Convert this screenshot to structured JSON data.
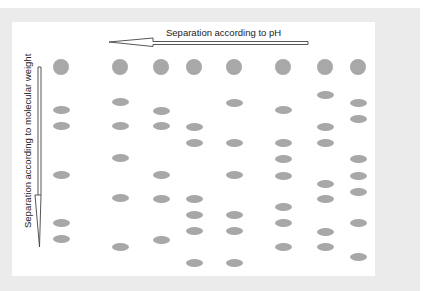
{
  "labels": {
    "horizontal": "Separation according to pH",
    "vertical": "Separation according to molecular weight"
  },
  "colors": {
    "spot": "#a8a8a8",
    "frame": "#ebebeb",
    "panel": "#ffffff",
    "arrow_stroke": "#444444"
  },
  "lanes": [
    {
      "x": 61,
      "circle_y": 67,
      "bands_y": [
        110,
        126,
        175,
        223,
        239
      ]
    },
    {
      "x": 120,
      "circle_y": 67,
      "bands_y": [
        102,
        126,
        158,
        198,
        247
      ]
    },
    {
      "x": 161,
      "circle_y": 67,
      "bands_y": [
        111,
        126,
        175,
        199,
        240
      ]
    },
    {
      "x": 194,
      "circle_y": 67,
      "bands_y": [
        127,
        143,
        199,
        215,
        231,
        263
      ]
    },
    {
      "x": 234,
      "circle_y": 67,
      "bands_y": [
        103,
        143,
        175,
        215,
        231,
        263
      ]
    },
    {
      "x": 283,
      "circle_y": 67,
      "bands_y": [
        110,
        143,
        159,
        176,
        207,
        223,
        247
      ]
    },
    {
      "x": 325,
      "circle_y": 67,
      "bands_y": [
        95,
        127,
        143,
        184,
        199,
        232,
        247
      ]
    },
    {
      "x": 358,
      "circle_y": 67,
      "bands_y": [
        103,
        119,
        159,
        176,
        192,
        223,
        257
      ]
    }
  ]
}
